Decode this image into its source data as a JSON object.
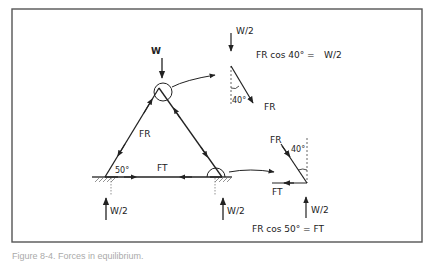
{
  "figure": {
    "caption": "Figure 8-4. Forces in equilibrium.",
    "colors": {
      "line": "#222222",
      "frame": "#555555",
      "background": "#ffffff",
      "dashed": "#555555"
    }
  },
  "truss": {
    "load_top": "W",
    "member_rafter": "FR",
    "member_tie": "FT",
    "angle_base": "50°",
    "reaction_left": "W/2",
    "reaction_right": "W/2"
  },
  "apex_detail": {
    "load": "W/2",
    "force": "FR",
    "angle": "40°",
    "equation_lhs": "FR cos 40° =",
    "equation_rhs": "W/2"
  },
  "support_detail": {
    "force_rafter": "FR",
    "force_tie": "FT",
    "angle": "40°",
    "reaction": "W/2",
    "equation": "FR cos 50° = FT"
  }
}
